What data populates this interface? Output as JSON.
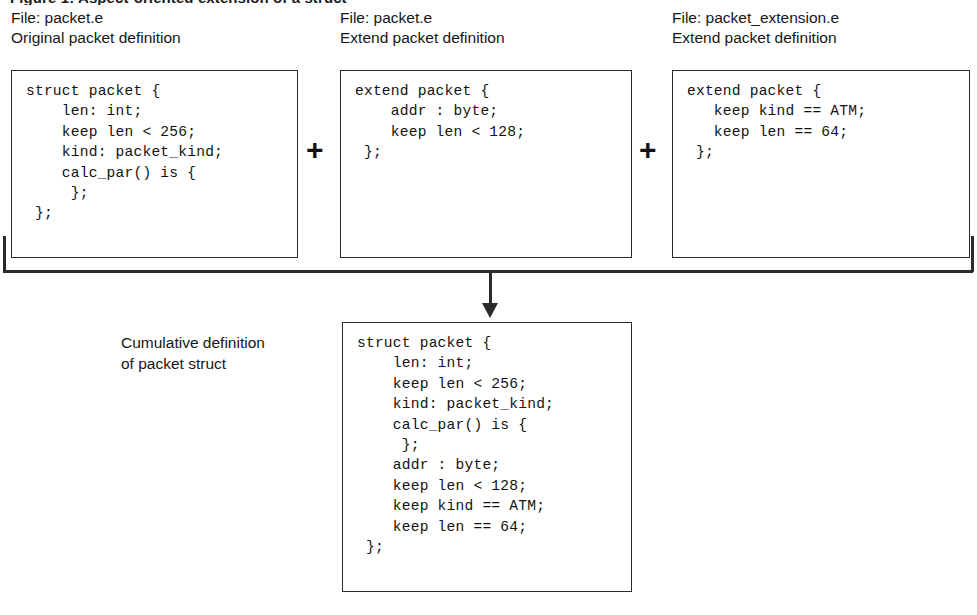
{
  "figure": {
    "top_caption": "Figure 1: Aspect-oriented extension of a struct",
    "arrow_icon": "down-arrow-icon",
    "bracket_icon": "merge-bracket-icon"
  },
  "sources": [
    {
      "file_label": "File: packet.e",
      "desc_label": "Original packet definition",
      "code": "struct packet {\n    len: int;\n    keep len < 256;\n    kind: packet_kind;\n    calc_par() is {\n     };\n };"
    },
    {
      "file_label": "File: packet.e",
      "desc_label": "Extend packet definition",
      "code": "extend packet {\n    addr : byte;\n    keep len < 128;\n };"
    },
    {
      "file_label": "File: packet_extension.e",
      "desc_label": "Extend packet definition",
      "code": "extend packet {\n   keep kind == ATM;\n   keep len == 64;\n };"
    }
  ],
  "operators": {
    "plus_one": "+",
    "plus_two": "+"
  },
  "result": {
    "label_line1": "Cumulative definition",
    "label_line2": "of packet struct",
    "code": "struct packet {\n    len: int;\n    keep len < 256;\n    kind: packet_kind;\n    calc_par() is {\n     };\n    addr : byte;\n    keep len < 128;\n    keep kind == ATM;\n    keep len == 64;\n };"
  },
  "colors": {
    "ink": "#2b2b2b",
    "text": "#161616",
    "background": "#ffffff"
  }
}
